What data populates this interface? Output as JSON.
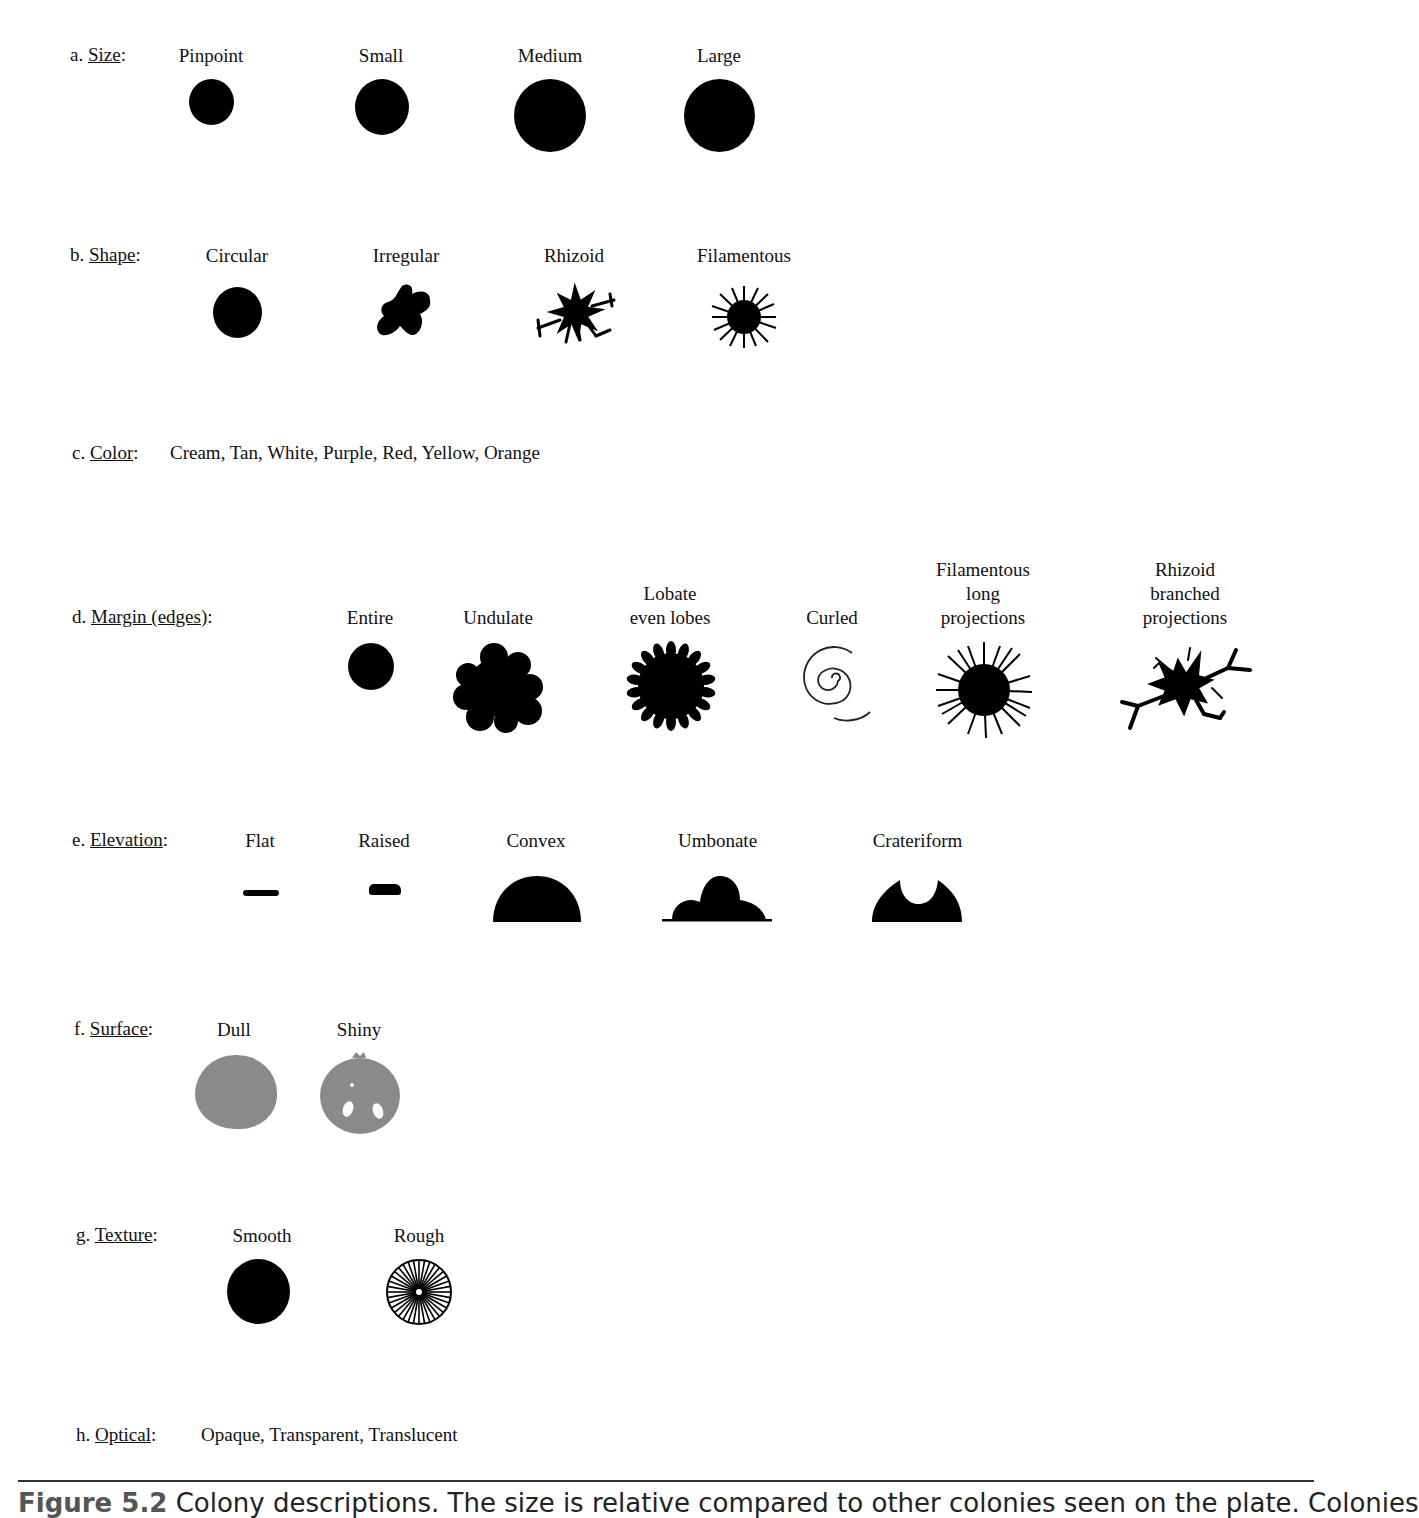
{
  "rows": {
    "size": {
      "prefix": "a.",
      "title": "Size",
      "suffix": ":",
      "items": [
        {
          "label": "Pinpoint"
        },
        {
          "label": "Small"
        },
        {
          "label": "Medium"
        },
        {
          "label": "Large"
        }
      ]
    },
    "shape": {
      "prefix": "b.",
      "title": "Shape",
      "suffix": ":",
      "items": [
        {
          "label": "Circular"
        },
        {
          "label": "Irregular"
        },
        {
          "label": "Rhizoid"
        },
        {
          "label": "Filamentous"
        }
      ]
    },
    "color": {
      "prefix": "c.",
      "title": "Color",
      "suffix": ":",
      "values": "Cream, Tan, White, Purple, Red, Yellow, Orange"
    },
    "margin": {
      "prefix": "d.",
      "title": "Margin (edges)",
      "suffix": ":",
      "items": [
        {
          "label": "Entire"
        },
        {
          "label": "Undulate"
        },
        {
          "label": "Lobate\neven lobes",
          "line1": "Lobate",
          "line2": "even lobes"
        },
        {
          "label": "Curled"
        },
        {
          "label": "Filamentous long projections",
          "line1": "Filamentous",
          "line2": "long",
          "line3": "projections"
        },
        {
          "label": "Rhizoid branched projections",
          "line1": "Rhizoid",
          "line2": "branched",
          "line3": "projections"
        }
      ]
    },
    "elevation": {
      "prefix": "e.",
      "title": "Elevation",
      "suffix": ":",
      "items": [
        {
          "label": "Flat"
        },
        {
          "label": "Raised"
        },
        {
          "label": "Convex"
        },
        {
          "label": "Umbonate"
        },
        {
          "label": "Crateriform"
        }
      ]
    },
    "surface": {
      "prefix": "f.",
      "title": "Surface",
      "suffix": ":",
      "items": [
        {
          "label": "Dull"
        },
        {
          "label": "Shiny"
        }
      ]
    },
    "texture": {
      "prefix": "g.",
      "title": "Texture",
      "suffix": ":",
      "items": [
        {
          "label": "Smooth"
        },
        {
          "label": "Rough"
        }
      ]
    },
    "optical": {
      "prefix": "h.",
      "title": "Optical",
      "suffix": ":",
      "values": "Opaque, Transparent, Translucent"
    }
  },
  "caption": {
    "figure": "Figure 5.2",
    "text": " Colony descriptions. The size is relative compared to other colonies seen on the plate. Colonies"
  },
  "colors": {
    "ink": "#000000",
    "surface_gray": "#8a8a8a",
    "background": "#ffffff"
  }
}
